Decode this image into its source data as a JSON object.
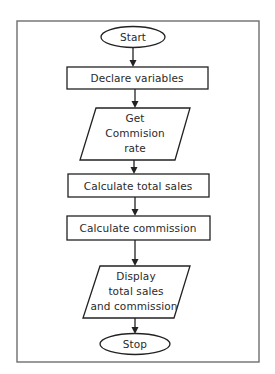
{
  "diagram": {
    "type": "flowchart",
    "direction": "top-to-bottom",
    "nodes": [
      {
        "id": "start",
        "shape": "terminator",
        "lines": [
          "Start"
        ]
      },
      {
        "id": "declare",
        "shape": "process",
        "lines": [
          "Declare variables"
        ]
      },
      {
        "id": "get_rate",
        "shape": "input-output",
        "lines": [
          "Get",
          "Commision",
          "rate"
        ]
      },
      {
        "id": "calc_sales",
        "shape": "process",
        "lines": [
          "Calculate total sales"
        ]
      },
      {
        "id": "calc_comm",
        "shape": "process",
        "lines": [
          "Calculate commission"
        ]
      },
      {
        "id": "display",
        "shape": "input-output",
        "lines": [
          "Display",
          "total sales",
          "and commission"
        ]
      },
      {
        "id": "stop",
        "shape": "terminator",
        "lines": [
          "Stop"
        ]
      }
    ],
    "edges": [
      {
        "from": "start",
        "to": "declare"
      },
      {
        "from": "declare",
        "to": "get_rate"
      },
      {
        "from": "get_rate",
        "to": "calc_sales"
      },
      {
        "from": "calc_sales",
        "to": "calc_comm"
      },
      {
        "from": "calc_comm",
        "to": "display"
      },
      {
        "from": "display",
        "to": "stop"
      }
    ]
  },
  "colors": {
    "stroke": "#222222",
    "frame": "#6e6e6e",
    "text": "#2a2a2a",
    "background": "#ffffff"
  }
}
